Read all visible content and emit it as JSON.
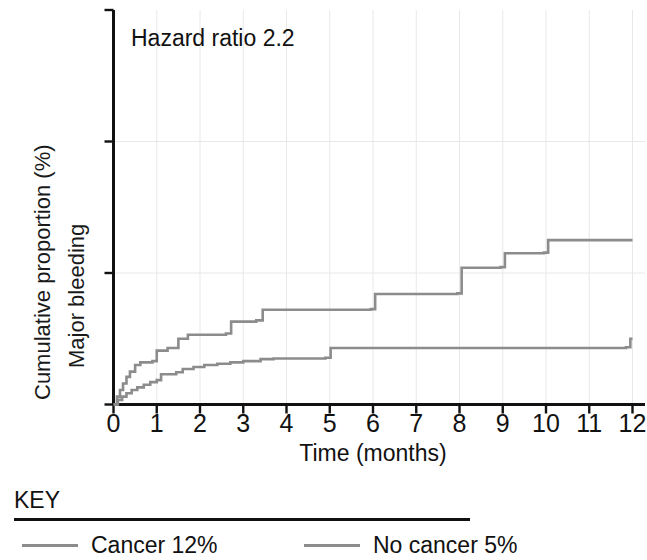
{
  "chart_data": {
    "type": "line",
    "subtype": "kaplan-meier-cumulative-incidence-step",
    "title": "",
    "xlabel": "Time (months)",
    "ylabel": "Cumulative proportion (%)",
    "ylabel_line2": "Major bleeding",
    "xlim": [
      0,
      12
    ],
    "ylim": [
      0,
      30
    ],
    "xticks": [
      0,
      1,
      2,
      3,
      4,
      5,
      6,
      7,
      8,
      9,
      10,
      11,
      12
    ],
    "xtick_labels": [
      "0",
      "1",
      "2",
      "3",
      "4",
      "5",
      "6",
      "7",
      "8",
      "9",
      "10",
      "11",
      "12"
    ],
    "yticks": [
      0,
      10,
      20,
      30
    ],
    "ytick_labels": [
      "0",
      "10",
      "20",
      "30"
    ],
    "grid": {
      "vertical": true,
      "horizontal": true,
      "horizontal_at": [
        10,
        20
      ],
      "color": "#e8e8e8"
    },
    "annotations": [
      {
        "text": "Hazard ratio 2.2",
        "x": 0.4,
        "y": 27.5
      }
    ],
    "legend": {
      "position": "below-plot",
      "title": "KEY",
      "entries": [
        {
          "name": "Cancer 12%",
          "color": "#8c8c8c"
        },
        {
          "name": "No cancer 5%",
          "color": "#8c8c8c"
        }
      ]
    },
    "series": [
      {
        "name": "Cancer 12%",
        "color": "#8c8c8c",
        "final_value": 12.5,
        "steps": [
          [
            0.0,
            0.0
          ],
          [
            0.08,
            0.6
          ],
          [
            0.15,
            1.1
          ],
          [
            0.22,
            1.6
          ],
          [
            0.3,
            2.1
          ],
          [
            0.38,
            2.5
          ],
          [
            0.5,
            3.0
          ],
          [
            0.62,
            3.2
          ],
          [
            0.9,
            3.3
          ],
          [
            1.0,
            4.1
          ],
          [
            1.25,
            4.3
          ],
          [
            1.5,
            5.0
          ],
          [
            1.72,
            5.3
          ],
          [
            2.6,
            5.4
          ],
          [
            2.72,
            6.3
          ],
          [
            3.3,
            6.4
          ],
          [
            3.45,
            7.2
          ],
          [
            5.95,
            7.25
          ],
          [
            6.05,
            8.4
          ],
          [
            7.95,
            8.45
          ],
          [
            8.05,
            10.4
          ],
          [
            8.95,
            10.45
          ],
          [
            9.05,
            11.5
          ],
          [
            9.95,
            11.55
          ],
          [
            10.05,
            12.5
          ],
          [
            12.0,
            12.5
          ]
        ]
      },
      {
        "name": "No cancer 5%",
        "color": "#8c8c8c",
        "final_value": 5.0,
        "steps": [
          [
            0.0,
            0.0
          ],
          [
            0.1,
            0.35
          ],
          [
            0.2,
            0.6
          ],
          [
            0.3,
            0.85
          ],
          [
            0.42,
            1.1
          ],
          [
            0.55,
            1.3
          ],
          [
            0.7,
            1.5
          ],
          [
            0.85,
            1.7
          ],
          [
            1.0,
            1.85
          ],
          [
            1.1,
            2.3
          ],
          [
            1.45,
            2.45
          ],
          [
            1.6,
            2.7
          ],
          [
            1.85,
            2.85
          ],
          [
            2.1,
            3.0
          ],
          [
            2.4,
            3.1
          ],
          [
            2.7,
            3.2
          ],
          [
            3.0,
            3.3
          ],
          [
            3.4,
            3.45
          ],
          [
            3.7,
            3.5
          ],
          [
            4.9,
            3.55
          ],
          [
            5.02,
            4.3
          ],
          [
            11.85,
            4.35
          ],
          [
            11.95,
            5.0
          ],
          [
            12.0,
            5.0
          ]
        ]
      }
    ]
  },
  "annotation": {
    "hazard_ratio": "Hazard ratio 2.2"
  },
  "axes": {
    "x_title": "Time (months)",
    "y_title_line1": "Cumulative proportion (%)",
    "y_title_line2": "Major bleeding"
  },
  "key": {
    "title": "KEY",
    "items": [
      {
        "label": "Cancer 12%"
      },
      {
        "label": "No cancer 5%"
      }
    ]
  }
}
